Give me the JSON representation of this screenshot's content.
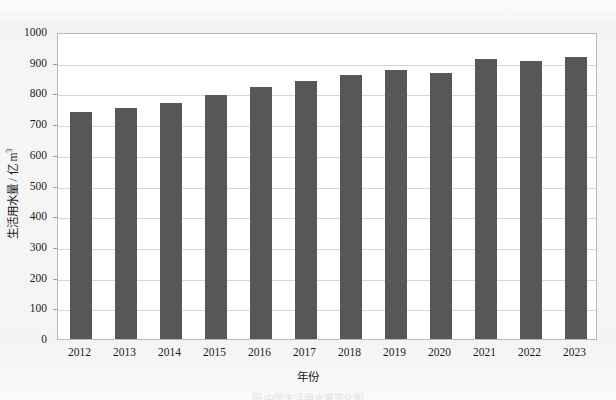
{
  "chart_data": {
    "type": "bar",
    "title": "",
    "xlabel": "年份",
    "ylabel": "生活用水量 / 亿 m³",
    "ylabel_main": "生活用水量 / 亿 m",
    "ylabel_exponent": "3",
    "categories": [
      "2012",
      "2013",
      "2014",
      "2015",
      "2016",
      "2017",
      "2018",
      "2019",
      "2020",
      "2021",
      "2022",
      "2023"
    ],
    "values": [
      740,
      751,
      768,
      794,
      822,
      840,
      861,
      876,
      868,
      913,
      907,
      917
    ],
    "ylim": [
      0,
      1000
    ],
    "yticks": [
      "0",
      "100",
      "200",
      "300",
      "400",
      "500",
      "600",
      "700",
      "800",
      "900",
      "1000"
    ],
    "ytick_values": [
      0,
      100,
      200,
      300,
      400,
      500,
      600,
      700,
      800,
      900,
      1000
    ],
    "grid": true,
    "grid_axis": "y",
    "legend": "none",
    "bar_color": "#575757",
    "plot_bg": "#ffffff",
    "figure_bg": "#f4f4f4",
    "grid_color": "#d6d6d6",
    "axis_color": "#b9b9b9"
  },
  "caption": {
    "text": "图 中国生活用水量变化图"
  }
}
